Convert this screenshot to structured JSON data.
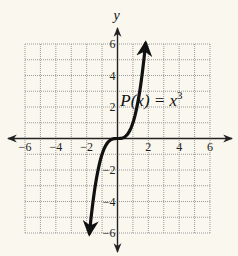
{
  "chart_data": {
    "type": "line",
    "title": "",
    "xlabel": "",
    "ylabel": "y",
    "xlim": [
      -6,
      6
    ],
    "ylim": [
      -6,
      6
    ],
    "grid": true,
    "x_ticks": [
      -6,
      -4,
      -2,
      2,
      4,
      6
    ],
    "y_ticks": [
      6,
      4,
      2,
      -2,
      -4,
      -6
    ],
    "x_tick_labels": [
      "−6",
      "−4",
      "−2",
      "2",
      "4",
      "6"
    ],
    "y_tick_labels": [
      "6",
      "4",
      "2",
      "−2",
      "−4",
      "−6"
    ],
    "series": [
      {
        "name": "P(x) = x^3",
        "function": "x^3",
        "x_range": [
          -1.82,
          1.82
        ],
        "arrows_at_ends": true
      }
    ],
    "annotations": [
      {
        "text_main": "P(x) = x",
        "superscript": "3",
        "near": [
          2,
          2.5
        ]
      }
    ],
    "colors": {
      "curve": "#111111",
      "grid": "#9a9a9a",
      "axis": "#222222",
      "background": "#f9f7ee"
    }
  }
}
